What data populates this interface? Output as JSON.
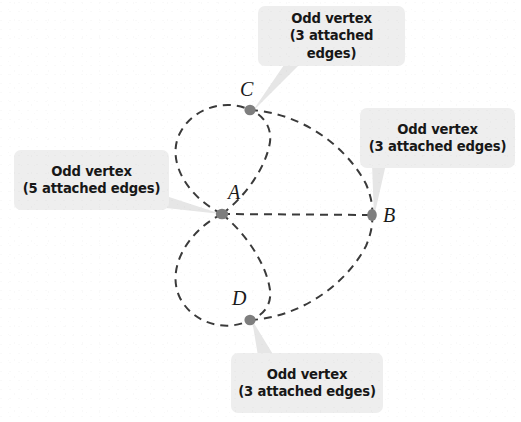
{
  "figure": {
    "type": "graph-diagram",
    "background_color": "#ffffff",
    "edge_color": "#3a3a3a",
    "vertex_color": "#808080",
    "callout_background": "#eeeeee",
    "callout_text_color": "#171717",
    "pointer_color": "#e2e2e2"
  },
  "vertices": [
    {
      "id": "A",
      "label": "A",
      "x": 222,
      "y": 214,
      "degree": 5,
      "label_x": 228,
      "label_y": 182
    },
    {
      "id": "B",
      "label": "B",
      "x": 372,
      "y": 215,
      "degree": 3,
      "label_x": 383,
      "label_y": 205
    },
    {
      "id": "C",
      "label": "C",
      "x": 250,
      "y": 110,
      "degree": 3,
      "label_x": 240,
      "label_y": 79
    },
    {
      "id": "D",
      "label": "D",
      "x": 250,
      "y": 320,
      "degree": 3,
      "label_x": 232,
      "label_y": 288
    }
  ],
  "edges": [
    {
      "from": "A",
      "to": "C",
      "style": "dashed",
      "shape": "left-loop"
    },
    {
      "from": "A",
      "to": "C",
      "style": "dashed",
      "shape": "inner-curve"
    },
    {
      "from": "C",
      "to": "B",
      "style": "dashed",
      "shape": "outer-curve"
    },
    {
      "from": "A",
      "to": "B",
      "style": "dashed",
      "shape": "straight"
    },
    {
      "from": "A",
      "to": "D",
      "style": "dashed",
      "shape": "left-loop"
    },
    {
      "from": "A",
      "to": "D",
      "style": "dashed",
      "shape": "inner-curve"
    },
    {
      "from": "D",
      "to": "B",
      "style": "dashed",
      "shape": "outer-curve"
    }
  ],
  "callouts": [
    {
      "id": "callout-c",
      "target": "C",
      "line1": "Odd vertex",
      "line2": "(3 attached edges)",
      "x": 258,
      "y": 6,
      "w": 147,
      "h": 60
    },
    {
      "id": "callout-b",
      "target": "B",
      "line1": "Odd vertex",
      "line2": "(3 attached edges)",
      "x": 360,
      "y": 108,
      "w": 155,
      "h": 60
    },
    {
      "id": "callout-a",
      "target": "A",
      "line1": "Odd vertex",
      "line2": "(5 attached edges)",
      "x": 14,
      "y": 150,
      "w": 155,
      "h": 60
    },
    {
      "id": "callout-d",
      "target": "D",
      "line1": "Odd vertex",
      "line2": "(3 attached edges)",
      "x": 231,
      "y": 353,
      "w": 152,
      "h": 60
    }
  ]
}
